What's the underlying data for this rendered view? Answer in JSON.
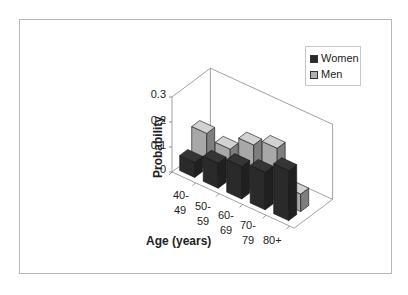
{
  "chart_data": {
    "type": "bar",
    "subtype": "3d-clustered",
    "title": "",
    "xlabel": "Age (years)",
    "ylabel": "Probability",
    "ylim": [
      0,
      0.3
    ],
    "yticks": [
      "0",
      "0.1",
      "0.2",
      "0.3"
    ],
    "categories": [
      "40-49",
      "50-59",
      "60-69",
      "70-79",
      "80+"
    ],
    "category_labels": [
      {
        "line1": "40-",
        "line2": "49"
      },
      {
        "line1": "50-",
        "line2": "59"
      },
      {
        "line1": "60-",
        "line2": "69"
      },
      {
        "line1": "70-",
        "line2": "79"
      },
      {
        "line1": "80+",
        "line2": ""
      }
    ],
    "series": [
      {
        "name": "Women",
        "values": [
          0.06,
          0.1,
          0.13,
          0.15,
          0.2
        ],
        "color": "#2a2a2a"
      },
      {
        "name": "Men",
        "values": [
          0.14,
          0.12,
          0.18,
          0.21,
          0.07
        ],
        "color": "#a8a8a8"
      }
    ],
    "legend_position": "top-right",
    "grid": false
  },
  "legend": {
    "items": [
      {
        "label": "Women",
        "color": "#2a2a2a"
      },
      {
        "label": "Men",
        "color": "#a8a8a8"
      }
    ]
  }
}
